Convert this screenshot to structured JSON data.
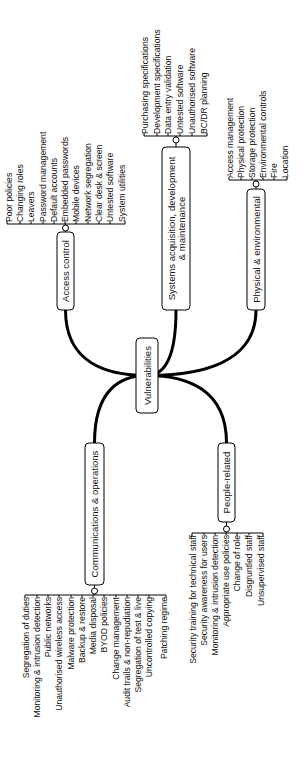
{
  "diagram": {
    "title": "Vulnerabilities",
    "orientation": "rotated-90-ccw",
    "center": {
      "label": "Vulnerabilities",
      "box": [
        136,
        338,
        22,
        75
      ]
    },
    "branches": [
      {
        "id": "access-control",
        "label_lines": [
          "Access control"
        ],
        "box": [
          57,
          232,
          17,
          78
        ],
        "anchor": [
          65.5,
          310
        ],
        "brace": {
          "y": 224,
          "x1": 7,
          "x2": 125,
          "side": "top"
        },
        "leaves": [
          {
            "label": "Poor policies",
            "x": 9
          },
          {
            "label": "Changing roles",
            "x": 20
          },
          {
            "label": "Leavers",
            "x": 31
          },
          {
            "label": "Password management",
            "x": 43
          },
          {
            "label": "Default accounts",
            "x": 54
          },
          {
            "label": "Embedded passwords",
            "x": 65
          },
          {
            "label": "Mobile devices",
            "x": 76
          },
          {
            "label": "Network segregation",
            "x": 88
          },
          {
            "label": "Clear desk & screen",
            "x": 99
          },
          {
            "label": "Untested software",
            "x": 110
          },
          {
            "label": "System utilities",
            "x": 122
          }
        ]
      },
      {
        "id": "systems-acquisition",
        "label_lines": [
          "Systems acquisition, development",
          "& maintenance"
        ],
        "box": [
          162,
          147,
          28,
          163
        ],
        "anchor": [
          176,
          310
        ],
        "brace": {
          "y": 136,
          "x1": 144,
          "x2": 207,
          "side": "top"
        },
        "leaves": [
          {
            "label": "Purchasing specifications",
            "x": 145
          },
          {
            "label": "Development specifications",
            "x": 157
          },
          {
            "label": "Data entry validation",
            "x": 168
          },
          {
            "label": "Untested software",
            "x": 180
          },
          {
            "label": "Unauthorised software",
            "x": 192
          },
          {
            "label": "BC/DR planning",
            "x": 204
          }
        ]
      },
      {
        "id": "physical-environmental",
        "label_lines": [
          "Physical & environmental"
        ],
        "box": [
          247,
          189,
          18,
          121
        ],
        "anchor": [
          256,
          310
        ],
        "brace": {
          "y": 180,
          "x1": 229,
          "x2": 287,
          "side": "top"
        },
        "leaves": [
          {
            "label": "Access management",
            "x": 230
          },
          {
            "label": "Physical protection",
            "x": 241
          },
          {
            "label": "Storage protection",
            "x": 252
          },
          {
            "label": "Environmental controls",
            "x": 263
          },
          {
            "label": "Fire",
            "x": 274
          },
          {
            "label": "Location",
            "x": 285
          }
        ]
      },
      {
        "id": "communications-operations",
        "label_lines": [
          "Communications & operations"
        ],
        "box": [
          85,
          443,
          19,
          142
        ],
        "anchor": [
          94.5,
          443
        ],
        "brace": {
          "y": 595,
          "x1": 25,
          "x2": 166,
          "side": "bottom"
        },
        "leaves": [
          {
            "label": "Segregation of duties",
            "x": 26
          },
          {
            "label": "Monitoring & intrusion detection",
            "x": 37
          },
          {
            "label": "Public networks",
            "x": 48
          },
          {
            "label": "Unauthorised wireless access",
            "x": 59
          },
          {
            "label": "Malware protection",
            "x": 71
          },
          {
            "label": "Backup & restore",
            "x": 82
          },
          {
            "label": "Media disposal",
            "x": 93
          },
          {
            "label": "BYOD policies",
            "x": 104
          },
          {
            "label": "Change management",
            "x": 116
          },
          {
            "label": "Audit trails & non-repudiation",
            "x": 127
          },
          {
            "label": "Segregation of test & live",
            "x": 138
          },
          {
            "label": "Uncontrolled copying",
            "x": 149
          },
          {
            "label": "Patching regime",
            "x": 164
          }
        ]
      },
      {
        "id": "people-related",
        "label_lines": [
          "People-related"
        ],
        "box": [
          218,
          443,
          17,
          79
        ],
        "anchor": [
          226.5,
          443
        ],
        "brace": {
          "y": 533,
          "x1": 192,
          "x2": 263,
          "side": "bottom"
        },
        "leaves": [
          {
            "label": "Security training for technical staff",
            "x": 193
          },
          {
            "label": "Security awareness for users",
            "x": 204
          },
          {
            "label": "Monitoring & intrusion detection",
            "x": 215
          },
          {
            "label": "Appropriate use policies",
            "x": 226
          },
          {
            "label": "Change of role",
            "x": 237
          },
          {
            "label": "Disgruntled staff",
            "x": 249
          },
          {
            "label": "Unsupervised staff",
            "x": 261
          }
        ]
      }
    ]
  },
  "colors": {
    "background": "#ffffff",
    "line": "#000000",
    "text": "#111111"
  }
}
